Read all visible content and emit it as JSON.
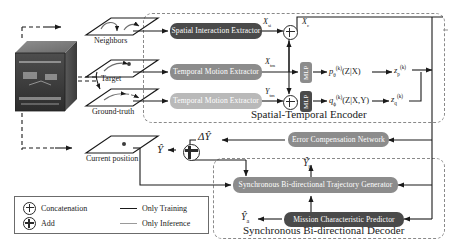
{
  "input_stage": {
    "scene_alt": "traffic-scene-image",
    "planes": [
      {
        "id": "neighbors",
        "label": "Neighbors"
      },
      {
        "id": "target",
        "label": "Target"
      },
      {
        "id": "groundtruth",
        "label": "Ground-truth"
      },
      {
        "id": "current",
        "label": "Current position"
      }
    ]
  },
  "encoder": {
    "title": "Spatial-Temporal Encoder",
    "blocks": [
      {
        "id": "spatial-interaction-extractor",
        "label": "Spatial Interaction Extractor",
        "shade": "dark"
      },
      {
        "id": "temporal-motion-extractor-x",
        "label": "Temporal Motion Extractor",
        "shade": "mid"
      },
      {
        "id": "temporal-motion-extractor-y",
        "label": "Temporal Motion Extractor",
        "shade": "light"
      }
    ],
    "mlp_label": "MLP",
    "vars": {
      "x_si": "X",
      "x_si_sub": "si",
      "x_c": "X",
      "x_c_sub": "c",
      "x_tm": "X",
      "x_tm_sub": "tm",
      "y_tm": "Y",
      "y_tm_sub": "tm"
    },
    "distributions": {
      "prior": "p",
      "prior_sub": "θ",
      "prior_sup": "(k)",
      "prior_args": "(Z|X)",
      "posterior": "q",
      "posterior_sub": "ϕ",
      "posterior_sup": "(k)",
      "posterior_args": "(Z|X,Y)",
      "z_prior": "z",
      "z_prior_sub": "p",
      "z_prior_sup": "(k)",
      "z_post": "z",
      "z_post_sub": "q",
      "z_post_sup": "(k)"
    }
  },
  "compensation": {
    "block_label": "Error Compensation Network",
    "delta": "ΔŶ",
    "output": "Ŷ"
  },
  "decoder": {
    "title": "Synchronous Bi-directional Decoder",
    "blocks": [
      {
        "id": "trajectory-generator",
        "label": "Synchronous Bi-directional Trajectory Generator",
        "shade": "mid"
      },
      {
        "id": "mission-characteristic-predictor",
        "label": "Mission Characteristic Predictor",
        "shade": "dark"
      }
    ],
    "outputs": {
      "y_b": "Ŷ",
      "y_b_sub": "b",
      "y_a": "Ŷ",
      "y_a_sub": "a"
    }
  },
  "legend": {
    "items": [
      {
        "id": "concatenation",
        "symbol": "concat-circle-icon",
        "label": "Concatenation"
      },
      {
        "id": "add",
        "symbol": "add-circle-icon",
        "label": "Add"
      }
    ],
    "lines": [
      {
        "id": "only-training",
        "label": "Only Training",
        "color": "#1a1a1a"
      },
      {
        "id": "only-inference",
        "label": "Only Inference",
        "color": "#9a9a9a"
      }
    ]
  },
  "colors": {
    "dark_block": "#4a4a4a",
    "mid_block": "#8c8c8c",
    "light_block": "#b9b9b9",
    "dashed_border": "#8a8a8a",
    "arrow": "#1a1a1a",
    "inference_arrow": "#9a9a9a"
  }
}
